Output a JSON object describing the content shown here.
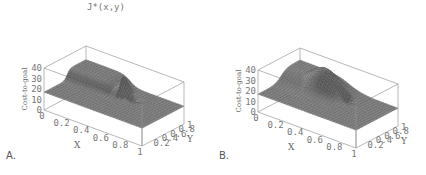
{
  "chart_data": [
    {
      "type": "surface",
      "panel_label": "A.",
      "title": "J*(x,y)",
      "xlabel": "X",
      "ylabel": "Y",
      "zlabel": "Cost-to-goal",
      "xlim": [
        0,
        1
      ],
      "ylim": [
        0,
        1
      ],
      "zlim": [
        0,
        40
      ],
      "xticks": [
        "0",
        "0.2",
        "0.4",
        "0.6",
        "0.8",
        "1"
      ],
      "yticks": [
        "0",
        "0.2",
        "0.4",
        "0.6",
        "0.8",
        "1"
      ],
      "zticks": [
        "0",
        "10",
        "20",
        "30",
        "40"
      ],
      "description": "Mostly flat cost surface near 15-20 with a raised ridge region at low x / high y and a sharp narrow peak near x=0.5, y=0.7 reaching about 40, dropping into a steep valley toward the goal",
      "base_level": 17,
      "features": [
        {
          "kind": "plateau",
          "x": [
            0.0,
            0.45
          ],
          "y": [
            0.55,
            1.0
          ],
          "height": 27
        },
        {
          "kind": "spike",
          "x": 0.5,
          "y": 0.72,
          "height": 40
        },
        {
          "kind": "valley",
          "x": 0.6,
          "y": 0.7,
          "depth": 5
        }
      ]
    },
    {
      "type": "surface",
      "panel_label": "B.",
      "title": "",
      "xlabel": "X",
      "ylabel": "Y",
      "zlabel": "Cost-to-goal",
      "xlim": [
        0,
        1
      ],
      "ylim": [
        0,
        1
      ],
      "zlim": [
        0,
        40
      ],
      "xticks": [
        "0",
        "0.2",
        "0.4",
        "0.6",
        "0.8",
        "1"
      ],
      "yticks": [
        "0",
        "0.2",
        "0.4",
        "0.6",
        "0.8",
        "1"
      ],
      "zticks": [
        "0",
        "10",
        "20",
        "30",
        "40"
      ],
      "description": "Smooth cost surface near 15-20 with a broad rounded hill at low x / high y peaking around 38, and a smooth dip toward the goal near x=0.6, y=0.7",
      "base_level": 17,
      "features": [
        {
          "kind": "hill",
          "x": 0.35,
          "y": 0.75,
          "height": 38
        },
        {
          "kind": "valley",
          "x": 0.6,
          "y": 0.7,
          "depth": 8
        }
      ]
    }
  ]
}
